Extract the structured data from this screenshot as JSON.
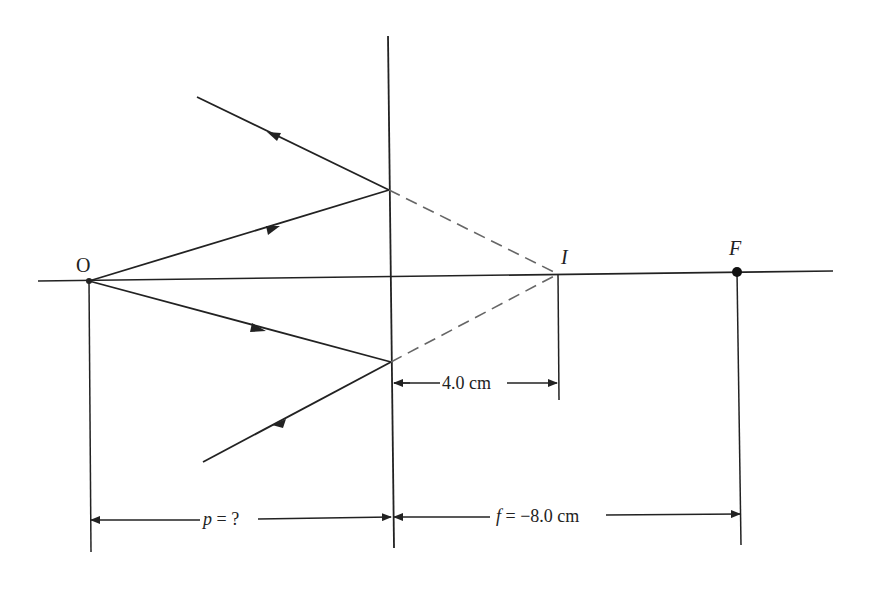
{
  "diagram": {
    "type": "diverging-mirror-ray-diagram",
    "labels": {
      "object": "O",
      "image": "I",
      "focal_point": "F",
      "image_distance": "4.0 cm",
      "object_distance": "p = ?",
      "object_distance_var": "p",
      "object_distance_rest": " = ?",
      "focal_length": "f = −8.0 cm",
      "focal_length_var": "f",
      "focal_length_rest": " = −8.0 cm"
    },
    "colors": {
      "line": "#222222",
      "dashed": "#555555",
      "background": "#ffffff"
    }
  }
}
